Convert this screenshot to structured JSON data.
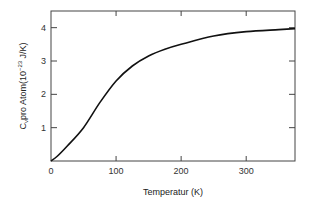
{
  "chart_data": {
    "type": "line",
    "title": "",
    "xlabel": "Temperatur (K)",
    "ylabel": "C_v pro Atom(10^-23 J/K)",
    "ylabel_parts": {
      "main": "C",
      "sub": "v",
      "rest": "pro Atom(10",
      "sup": "−23",
      "unit": " J/K)"
    },
    "xlim": [
      0,
      375
    ],
    "ylim": [
      0,
      4.5
    ],
    "xticks": [
      "0",
      "100",
      "200",
      "300"
    ],
    "yticks": [
      "1",
      "2",
      "3",
      "4"
    ],
    "grid": false,
    "series": [
      {
        "name": "C_v",
        "x": [
          0,
          10,
          25,
          50,
          75,
          100,
          125,
          150,
          175,
          200,
          250,
          300,
          350,
          375
        ],
        "values": [
          0,
          0.15,
          0.45,
          1.0,
          1.75,
          2.4,
          2.85,
          3.15,
          3.35,
          3.5,
          3.75,
          3.88,
          3.94,
          3.97
        ]
      }
    ]
  }
}
